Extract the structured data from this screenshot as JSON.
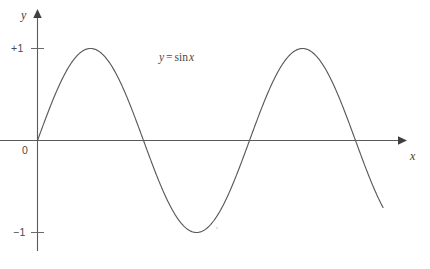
{
  "figure": {
    "name": "sine-function-graph",
    "background_color": "#ffffff",
    "axis_color": "#5a5a5a",
    "curve_color": "#5a5a5a",
    "text_color": "#4a4a4a"
  },
  "axes": {
    "y_axis_label": "y",
    "x_axis_label": "x",
    "origin_label": "0",
    "y_ticks": [
      {
        "label": "+1",
        "value": 1
      },
      {
        "label": "−1",
        "value": -1
      }
    ]
  },
  "annotation": {
    "full_text": "y = sin x",
    "lhs": "y",
    "operator": "=",
    "function_name": "sin",
    "argument": "x"
  },
  "chart_data": {
    "type": "line",
    "title": "",
    "subtitle": "",
    "xlabel": "x",
    "ylabel": "y",
    "annotations": [
      "y = sin x"
    ],
    "grid": false,
    "legend_position": "none",
    "xlim": [
      0,
      3.48
    ],
    "ylim": [
      -1.1,
      1.1
    ],
    "xtick_labels": [],
    "ytick_labels": [
      "+1",
      "0",
      "−1"
    ],
    "ytick_values": [
      1,
      0,
      -1
    ],
    "series": [
      {
        "name": "y = sin x",
        "color": "#5a5a5a",
        "equation": "y = sin(x)",
        "x_unit": "pi radians",
        "amplitude": 1,
        "period": 2,
        "phase": 0,
        "x_start": 0,
        "x_end": 3.26,
        "key_points": [
          {
            "x": 0.0,
            "y": 0,
            "kind": "zero-crossing"
          },
          {
            "x": 0.5,
            "y": 1,
            "kind": "maximum"
          },
          {
            "x": 1.0,
            "y": 0,
            "kind": "zero-crossing"
          },
          {
            "x": 1.5,
            "y": -1,
            "kind": "minimum"
          },
          {
            "x": 2.0,
            "y": 0,
            "kind": "zero-crossing"
          },
          {
            "x": 2.5,
            "y": 1,
            "kind": "maximum"
          },
          {
            "x": 3.0,
            "y": 0,
            "kind": "zero-crossing"
          },
          {
            "x": 3.26,
            "y": -0.77,
            "kind": "endpoint"
          }
        ],
        "x": [
          0,
          0.1,
          0.2,
          0.3,
          0.4,
          0.5,
          0.6,
          0.7,
          0.8,
          0.9,
          1.0,
          1.1,
          1.2,
          1.3,
          1.4,
          1.5,
          1.6,
          1.7,
          1.8,
          1.9,
          2.0,
          2.1,
          2.2,
          2.3,
          2.4,
          2.5,
          2.6,
          2.7,
          2.8,
          2.9,
          3.0,
          3.1,
          3.2,
          3.26
        ],
        "values": [
          0,
          0.309,
          0.588,
          0.809,
          0.951,
          1.0,
          0.951,
          0.809,
          0.588,
          0.309,
          0,
          -0.309,
          -0.588,
          -0.809,
          -0.951,
          -1.0,
          -0.951,
          -0.809,
          -0.588,
          -0.309,
          0,
          0.309,
          0.588,
          0.809,
          0.951,
          1.0,
          0.951,
          0.809,
          0.588,
          0.309,
          0,
          -0.309,
          -0.588,
          -0.77
        ]
      }
    ]
  }
}
